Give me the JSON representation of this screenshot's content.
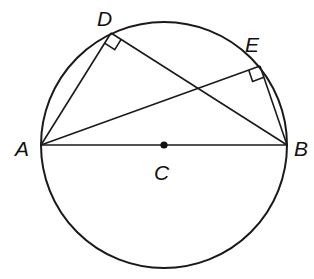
{
  "diagram": {
    "type": "geometry",
    "circle": {
      "center_label": "C",
      "cx": 164,
      "cy": 145,
      "r": 123
    },
    "points": {
      "A": {
        "label": "A",
        "x": 41,
        "y": 145
      },
      "B": {
        "label": "B",
        "x": 287,
        "y": 145
      },
      "C": {
        "label": "C",
        "x": 164,
        "y": 145
      },
      "D": {
        "label": "D",
        "x": 111,
        "y": 33
      },
      "E": {
        "label": "E",
        "x": 260,
        "y": 66
      }
    },
    "segments": [
      [
        "A",
        "B"
      ],
      [
        "A",
        "D"
      ],
      [
        "D",
        "B"
      ],
      [
        "A",
        "E"
      ],
      [
        "E",
        "B"
      ]
    ],
    "right_angles": [
      "D",
      "E"
    ],
    "labels": {
      "A": "A",
      "B": "B",
      "C": "C",
      "D": "D",
      "E": "E"
    },
    "colors": {
      "stroke": "#1a1a1a",
      "background": "#ffffff"
    }
  }
}
